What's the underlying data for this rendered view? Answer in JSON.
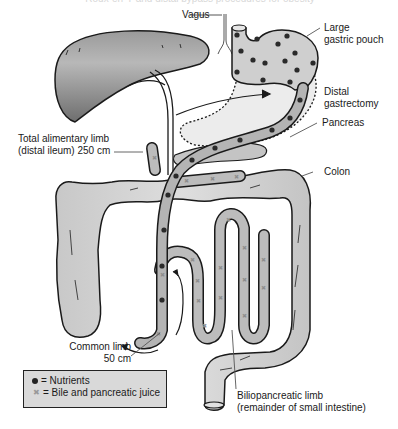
{
  "figure": {
    "title_clipped": "Roux-en-Y and distal bypass procedures for obesity"
  },
  "labels": {
    "vagus": "Vagus",
    "large_gastric_pouch_1": "Large",
    "large_gastric_pouch_2": "gastric pouch",
    "distal_gastrectomy_1": "Distal",
    "distal_gastrectomy_2": "gastrectomy",
    "pancreas": "Pancreas",
    "colon": "Colon",
    "total_alimentary_limb_1": "Total alimentary limb",
    "total_alimentary_limb_2": "(distal ileum) 250 cm",
    "common_limb_1": "Common limb",
    "common_limb_2": "50 cm",
    "biliopancreatic_limb_1": "Biliopancreatic limb",
    "biliopancreatic_limb_2": "(remainder of small intestine)"
  },
  "legend": {
    "items": [
      {
        "symbol": "●",
        "symbol_name": "filled-dot",
        "label": "= Nutrients"
      },
      {
        "symbol": "✖",
        "symbol_name": "x-mark",
        "label": "= Bile and pancreatic juice"
      }
    ]
  },
  "colors": {
    "liver": "#7a7a7a",
    "organ_fill": "#d4d4d4",
    "colon_fill": "#d0d0d0",
    "limb_fill": "#b8b8b8",
    "outline": "#1a1a1a",
    "legend_bg": "#d9d9d9"
  }
}
